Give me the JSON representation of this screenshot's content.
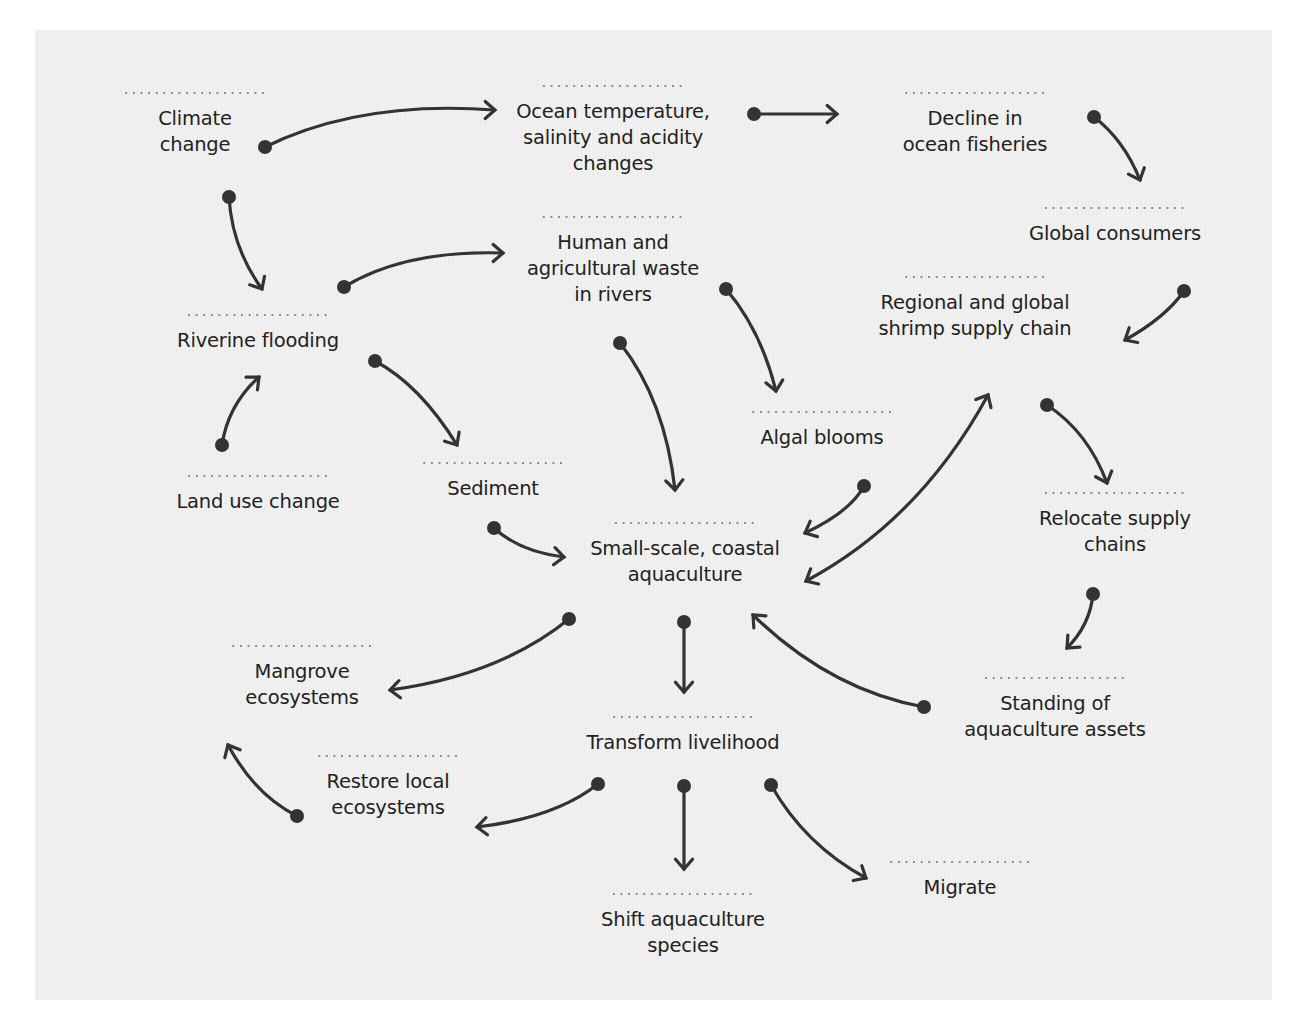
{
  "diagram": {
    "type": "causal-loop / influence diagram",
    "colors": {
      "background": "#efefef",
      "surround": "#ffffff",
      "text": "#222222",
      "arrow": "#333333",
      "dotted_rule": "#8a8a8a"
    },
    "nodes": [
      {
        "id": "climate-change",
        "label": "Climate\nchange",
        "x": 195,
        "y": 92,
        "rule_w": 145
      },
      {
        "id": "ocean-changes",
        "label": "Ocean temperature,\nsalinity and acidity\nchanges",
        "x": 613,
        "y": 85,
        "rule_w": 145
      },
      {
        "id": "decline-fisheries",
        "label": "Decline in\nocean fisheries",
        "x": 975,
        "y": 92,
        "rule_w": 145
      },
      {
        "id": "global-consumers",
        "label": "Global consumers",
        "x": 1115,
        "y": 207,
        "rule_w": 145
      },
      {
        "id": "human-waste",
        "label": "Human and\nagricultural waste\nin rivers",
        "x": 613,
        "y": 216,
        "rule_w": 145
      },
      {
        "id": "shrimp-supply-chain",
        "label": "Regional and global\nshrimp supply chain",
        "x": 975,
        "y": 276,
        "rule_w": 145
      },
      {
        "id": "riverine-flooding",
        "label": "Riverine flooding",
        "x": 258,
        "y": 314,
        "rule_w": 145
      },
      {
        "id": "algal-blooms",
        "label": "Algal blooms",
        "x": 822,
        "y": 411,
        "rule_w": 145
      },
      {
        "id": "sediment",
        "label": "Sediment",
        "x": 493,
        "y": 462,
        "rule_w": 145
      },
      {
        "id": "land-use-change",
        "label": "Land use change",
        "x": 258,
        "y": 475,
        "rule_w": 145
      },
      {
        "id": "relocate-supply-chains",
        "label": "Relocate supply\nchains",
        "x": 1115,
        "y": 492,
        "rule_w": 145
      },
      {
        "id": "small-scale-aquaculture",
        "label": "Small-scale, coastal\naquaculture",
        "x": 685,
        "y": 522,
        "rule_w": 145
      },
      {
        "id": "mangrove-ecosystems",
        "label": "Mangrove\necosystems",
        "x": 302,
        "y": 645,
        "rule_w": 145
      },
      {
        "id": "standing-assets",
        "label": "Standing of\naquaculture assets",
        "x": 1055,
        "y": 677,
        "rule_w": 145
      },
      {
        "id": "transform-livelihood",
        "label": "Transform livelihood",
        "x": 683,
        "y": 716,
        "rule_w": 145
      },
      {
        "id": "restore-ecosystems",
        "label": "Restore local\necosystems",
        "x": 388,
        "y": 755,
        "rule_w": 145
      },
      {
        "id": "migrate",
        "label": "Migrate",
        "x": 960,
        "y": 861,
        "rule_w": 145
      },
      {
        "id": "shift-species",
        "label": "Shift aquaculture\nspecies",
        "x": 683,
        "y": 893,
        "rule_w": 145
      }
    ],
    "edges": [
      {
        "from": "climate-change",
        "to": "ocean-changes",
        "path": "M265,147 Q360,100 495,110",
        "head_end": [
          495,
          110
        ],
        "head_end_angle": 0
      },
      {
        "from": "climate-change",
        "to": "riverine-flooding",
        "path": "M229,197 Q232,248 262,289",
        "head_end": [
          262,
          289
        ],
        "head_end_angle": 60
      },
      {
        "from": "ocean-changes",
        "to": "decline-fisheries",
        "path": "M754,114 L837,114",
        "head_end": [
          837,
          114
        ],
        "head_end_angle": 0
      },
      {
        "from": "decline-fisheries",
        "to": "global-consumers",
        "path": "M1094,117 Q1124,140 1140,180",
        "head_end": [
          1140,
          180
        ],
        "head_end_angle": 68
      },
      {
        "from": "riverine-flooding",
        "to": "human-waste",
        "path": "M344,287 Q405,250 503,253",
        "head_end": [
          503,
          253
        ],
        "head_end_angle": 0
      },
      {
        "from": "human-waste",
        "to": "algal-blooms",
        "path": "M726,289 Q761,330 776,391",
        "head_end": [
          776,
          391
        ],
        "head_end_angle": 80
      },
      {
        "from": "human-waste",
        "to": "small-scale-aquaculture",
        "path": "M620,343 Q665,400 675,490",
        "head_end": [
          675,
          490
        ],
        "head_end_angle": 86
      },
      {
        "from": "global-consumers",
        "to": "shrimp-supply-chain",
        "path": "M1184,291 Q1165,318 1125,340",
        "head_end": [
          1125,
          340
        ],
        "head_end_angle": 150
      },
      {
        "from": "land-use-change",
        "to": "riverine-flooding",
        "path": "M222,445 Q228,405 259,377",
        "head_end": [
          259,
          377
        ],
        "head_end_angle": -42
      },
      {
        "from": "riverine-flooding",
        "to": "sediment",
        "path": "M375,361 Q420,385 457,445",
        "head_end": [
          457,
          445
        ],
        "head_end_angle": 58
      },
      {
        "from": "algal-blooms",
        "to": "small-scale-aquaculture",
        "path": "M864,486 Q850,512 805,533",
        "head_end": [
          805,
          533
        ],
        "head_end_angle": 155
      },
      {
        "from": "shrimp-supply-chain",
        "to": "small-scale-aquaculture",
        "path": "M988,395 Q920,520 806,581",
        "head_start": [
          988,
          395
        ],
        "head_start_angle": -62,
        "head_end": [
          806,
          581
        ],
        "head_end_angle": 152,
        "bidirectional": true
      },
      {
        "from": "shrimp-supply-chain",
        "to": "relocate-supply-chains",
        "path": "M1047,405 Q1088,432 1107,483",
        "head_end": [
          1107,
          483
        ],
        "head_end_angle": 70
      },
      {
        "from": "sediment",
        "to": "small-scale-aquaculture",
        "path": "M494,528 Q520,552 564,557",
        "head_end": [
          564,
          557
        ],
        "head_end_angle": 5
      },
      {
        "from": "relocate-supply-chains",
        "to": "standing-assets",
        "path": "M1093,594 Q1090,625 1067,648",
        "head_end": [
          1067,
          648
        ],
        "head_end_angle": 135
      },
      {
        "from": "small-scale-aquaculture",
        "to": "mangrove-ecosystems",
        "path": "M569,619 Q500,675 390,690",
        "head_end": [
          390,
          690
        ],
        "head_end_angle": 175
      },
      {
        "from": "small-scale-aquaculture",
        "to": "transform-livelihood",
        "path": "M684,622 L684,692",
        "head_end": [
          684,
          692
        ],
        "head_end_angle": 90
      },
      {
        "from": "standing-assets",
        "to": "small-scale-aquaculture",
        "path": "M924,707 Q830,690 753,615",
        "head_end": [
          753,
          615
        ],
        "head_end_angle": -135
      },
      {
        "from": "restore-ecosystems",
        "to": "mangrove-ecosystems",
        "path": "M297,816 Q255,795 228,745",
        "head_end": [
          228,
          745
        ],
        "head_end_angle": -117
      },
      {
        "from": "transform-livelihood",
        "to": "restore-ecosystems",
        "path": "M598,784 Q555,818 477,827",
        "head_end": [
          477,
          827
        ],
        "head_end_angle": 175
      },
      {
        "from": "transform-livelihood",
        "to": "shift-species",
        "path": "M684,786 L684,869",
        "head_end": [
          684,
          869
        ],
        "head_end_angle": 90
      },
      {
        "from": "transform-livelihood",
        "to": "migrate",
        "path": "M771,785 Q805,845 866,878",
        "head_end": [
          866,
          878
        ],
        "head_end_angle": 30
      }
    ]
  }
}
